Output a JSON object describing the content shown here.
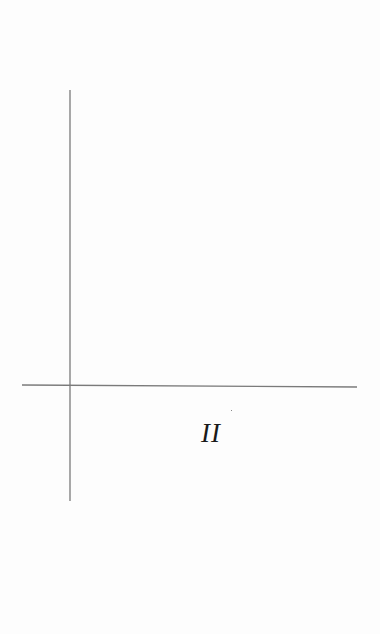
{
  "diagram": {
    "type": "coordinate-axes-quadrant",
    "quadrant_label": "II",
    "axes": {
      "vertical": {
        "x": 70,
        "y1": 90,
        "y2": 501
      },
      "horizontal": {
        "x1": 22,
        "y1": 385,
        "x2": 357,
        "y2": 387
      }
    },
    "colors": {
      "background": "#fdfdfd",
      "axis_line": "#7a7a7a",
      "label": "#1a1a1a"
    }
  }
}
